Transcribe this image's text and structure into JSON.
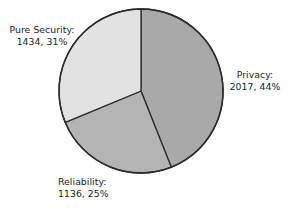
{
  "chart_data": {
    "type": "pie",
    "title": "",
    "subtitle": "",
    "xlabel": "",
    "ylabel": "",
    "grid": false,
    "legend_position": "none",
    "label_style": "outside-callout-text",
    "start_angle_deg": 0,
    "direction": "clockwise",
    "total": 4587,
    "categories": [
      "Privacy",
      "Reliability",
      "Pure Security"
    ],
    "values": [
      2017,
      1136,
      1434
    ],
    "percents": [
      44,
      25,
      31
    ],
    "slices": [
      {
        "name": "Privacy",
        "value": 2017,
        "percent": 44,
        "color": "#a9a9a9",
        "label_name": "Privacy:",
        "label_value": "2017, 44%"
      },
      {
        "name": "Reliability",
        "value": 1136,
        "percent": 25,
        "color": "#b4b4b4",
        "label_name": "Reliability:",
        "label_value": "1136, 25%"
      },
      {
        "name": "Pure Security",
        "value": 1434,
        "percent": 31,
        "color": "#e2e2e2",
        "label_name": "Pure Security:",
        "label_value": "1434, 31%"
      }
    ]
  },
  "figure": {
    "background": "#ffffff",
    "outline_color": "#2b2b2b",
    "text_color": "#1c1c1c"
  },
  "labels": {
    "privacy": {
      "name": "Privacy:",
      "value": "2017, 44%"
    },
    "reliability": {
      "name": "Reliability:",
      "value": "1136, 25%"
    },
    "pure_security": {
      "name": "Pure Security:",
      "value": "1434, 31%"
    }
  }
}
